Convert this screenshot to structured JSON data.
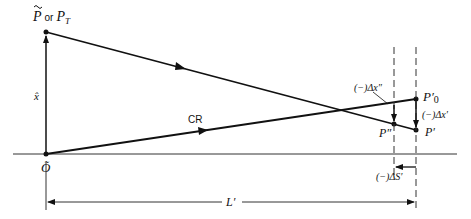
{
  "diagram": {
    "labels": {
      "top_point": "P̃ or P",
      "top_point_main": "P",
      "top_point_or": "or",
      "top_point_alt": "P",
      "top_point_alt_sub": "T",
      "vertical_axis": "x̂",
      "origin": "Õ",
      "chief_ray": "CR",
      "delta_x_double_prime": "(−)Δx″",
      "delta_x_prime": "(−)Δx′",
      "p_zero_prime": "P′",
      "p_zero_sub": "0",
      "p_double_prime": "P″",
      "p_prime": "P′",
      "delta_s_prime": "(−)ΔS′",
      "l_prime": "L′"
    },
    "colors": {
      "line": "#111111",
      "background": "#ffffff"
    }
  }
}
